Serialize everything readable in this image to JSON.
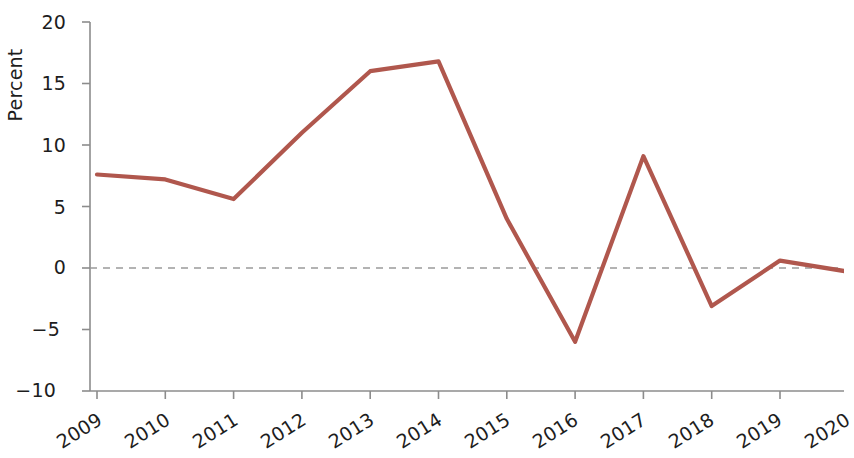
{
  "chart_data": {
    "type": "line",
    "title": "",
    "subtitle": "",
    "xlabel": "",
    "ylabel": "Percent",
    "categories": [
      "2009",
      "2010",
      "2011",
      "2012",
      "2013",
      "2014",
      "2015",
      "2016",
      "2017",
      "2018",
      "2019",
      "2020"
    ],
    "values": [
      7.6,
      7.2,
      5.6,
      11.0,
      16.0,
      16.8,
      4.0,
      -6.0,
      9.1,
      -3.1,
      0.6,
      -0.3
    ],
    "series": [
      {
        "name": "Percent",
        "color": "#b0574d",
        "values": [
          7.6,
          7.2,
          5.6,
          11.0,
          16.0,
          16.8,
          4.0,
          -6.0,
          9.1,
          -3.1,
          0.6,
          -0.3
        ]
      }
    ],
    "ylim": [
      -10,
      20
    ],
    "yticks": [
      -10,
      -5,
      0,
      5,
      10,
      15,
      20
    ],
    "ytick_labels": [
      "−10",
      "−5",
      "0",
      "5",
      "10",
      "15",
      "20"
    ],
    "xtick_labels": [
      "2009",
      "2010",
      "2011",
      "2012",
      "2013",
      "2014",
      "2015",
      "2016",
      "2017",
      "2018",
      "2019",
      "2020"
    ],
    "grid": false,
    "zero_line": true,
    "zero_line_style": "dashed",
    "zero_line_color": "#9a9a9a",
    "legend": null,
    "legend_position": "none",
    "annotations": [],
    "axis_color": "#8c8c8c",
    "text_color": "#1d1d1d"
  },
  "axes": {
    "ylabel": "Percent",
    "y_ticks": [
      {
        "value": 20,
        "label": "20"
      },
      {
        "value": 15,
        "label": "15"
      },
      {
        "value": 10,
        "label": "10"
      },
      {
        "value": 5,
        "label": "5"
      },
      {
        "value": 0,
        "label": "0"
      },
      {
        "value": -5,
        "label": "−5"
      },
      {
        "value": -10,
        "label": "−10"
      }
    ],
    "x_ticks": [
      {
        "label": "2009"
      },
      {
        "label": "2010"
      },
      {
        "label": "2011"
      },
      {
        "label": "2012"
      },
      {
        "label": "2013"
      },
      {
        "label": "2014"
      },
      {
        "label": "2015"
      },
      {
        "label": "2016"
      },
      {
        "label": "2017"
      },
      {
        "label": "2018"
      },
      {
        "label": "2019"
      },
      {
        "label": "2020"
      }
    ]
  }
}
